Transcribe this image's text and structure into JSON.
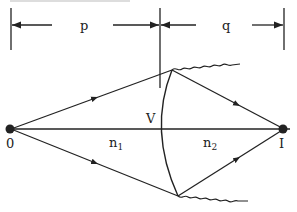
{
  "diagram": {
    "labels": {
      "p": "p",
      "q": "q",
      "vertex": "V",
      "object": "0",
      "image": "I",
      "n1": "n",
      "n1_sub": "1",
      "n2": "n",
      "n2_sub": "2"
    },
    "colors": {
      "line": "#222222",
      "background": "#ffffff"
    }
  }
}
